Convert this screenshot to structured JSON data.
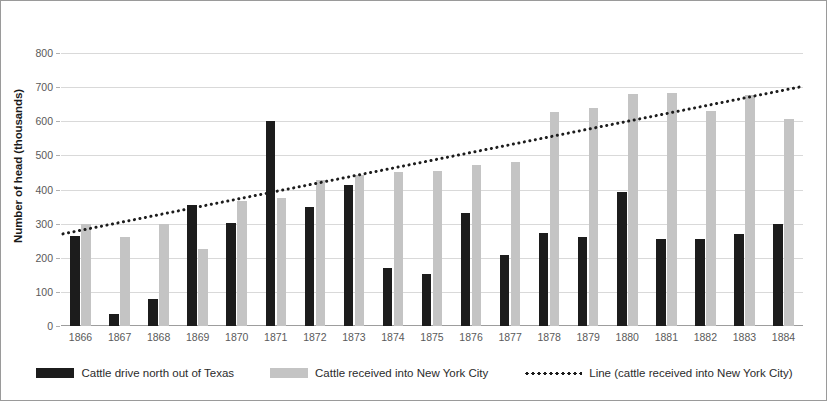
{
  "chart_data": {
    "type": "bar",
    "title": "",
    "xlabel": "",
    "ylabel": "Number of head (thousands)",
    "ylim": [
      0,
      800
    ],
    "ytick_step": 100,
    "yticks": [
      "0",
      "100",
      "200",
      "300",
      "400",
      "500",
      "600",
      "700",
      "800"
    ],
    "grid": true,
    "legend_position": "bottom",
    "categories": [
      "1866",
      "1867",
      "1868",
      "1869",
      "1870",
      "1871",
      "1872",
      "1873",
      "1874",
      "1875",
      "1876",
      "1877",
      "1878",
      "1879",
      "1880",
      "1881",
      "1882",
      "1883",
      "1884"
    ],
    "series": [
      {
        "name": "Cattle drive north out of Texas",
        "color": "#1c1c1c",
        "type": "bar",
        "values": [
          264,
          35,
          78,
          354,
          301,
          600,
          348,
          412,
          170,
          152,
          330,
          208,
          272,
          260,
          394,
          255,
          255,
          270,
          300
        ]
      },
      {
        "name": "Cattle received into New York City",
        "color": "#c4c4c4",
        "type": "bar",
        "values": [
          299,
          260,
          299,
          226,
          365,
          375,
          428,
          443,
          450,
          455,
          473,
          481,
          628,
          640,
          681,
          684,
          630,
          678,
          606
        ]
      },
      {
        "name": "Line (cattle received into New York City)",
        "color": "#1c1c1c",
        "type": "line-trend",
        "style": "dotted",
        "endpoints": [
          270,
          700
        ]
      }
    ]
  },
  "legend": {
    "items": [
      {
        "label": "Cattle drive north out of Texas",
        "swatch": "dark"
      },
      {
        "label": "Cattle received into New York City",
        "swatch": "light"
      },
      {
        "label": "Line (cattle received into New York City)",
        "swatch": "dotline"
      }
    ]
  }
}
